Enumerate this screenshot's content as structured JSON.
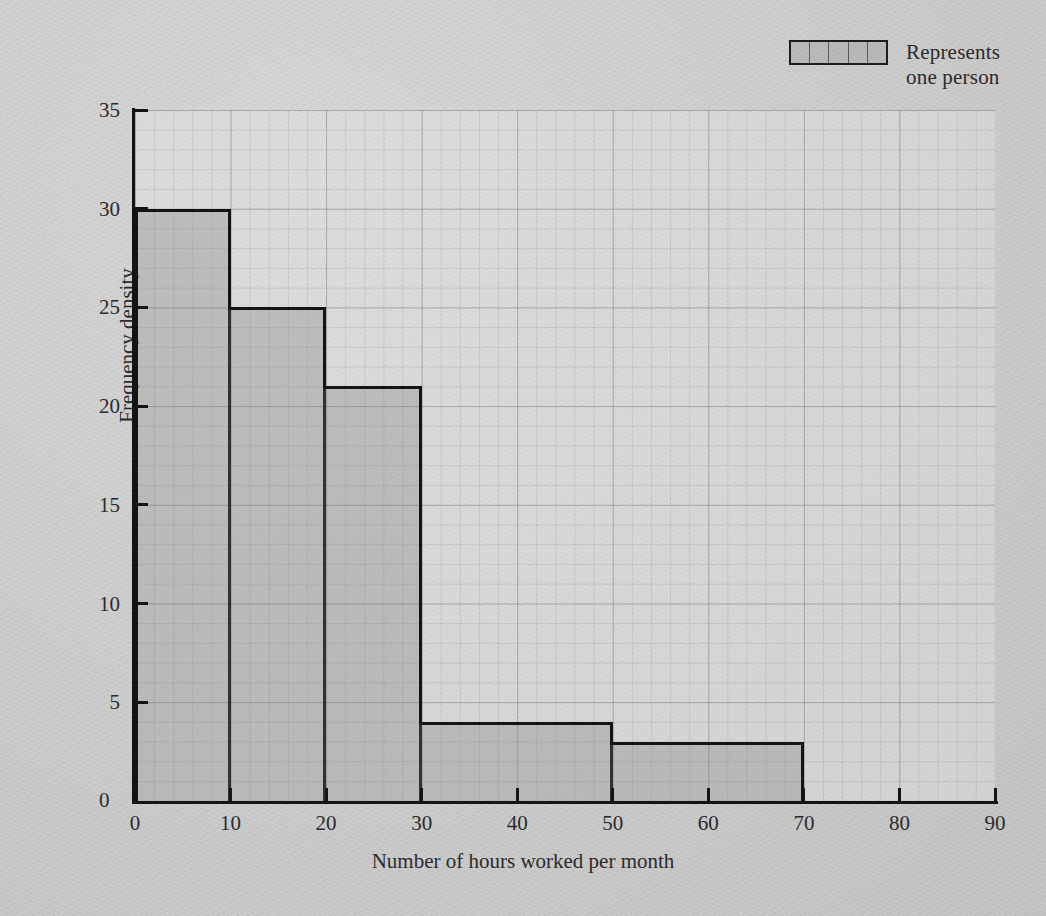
{
  "legend": {
    "label": "Represents\none person",
    "swatch_cells": 5,
    "swatch_name": "legend-swatch"
  },
  "axis_titles": {
    "x": "Number of hours worked per month",
    "y": "Frequency density"
  },
  "origin_label": "0",
  "colors": {
    "page_background": "#cacaca",
    "plot_background": "#e4e4e4",
    "bar_fill": "#9b9b9b",
    "bar_stroke": "#141414",
    "grid_major": "#5a5a5a",
    "grid_minor": "#6e6e6e",
    "text": "#2b2b2b"
  },
  "chart_data": {
    "type": "bar",
    "title": "",
    "subtitle": "",
    "xlabel": "Number of hours worked per month",
    "ylabel": "Frequency density",
    "xlim": [
      0,
      90
    ],
    "ylim": [
      0,
      35
    ],
    "xticks": [
      0,
      10,
      20,
      30,
      40,
      50,
      60,
      70,
      80,
      90
    ],
    "yticks": [
      0,
      5,
      10,
      15,
      20,
      25,
      30,
      35
    ],
    "grid": true,
    "grid_minor_step_x": 2,
    "grid_minor_step_y": 1,
    "legend": {
      "position": "top-right",
      "entries": [
        "Represents one person"
      ]
    },
    "bins": [
      {
        "label": "0-10",
        "x_start": 0,
        "x_end": 10,
        "frequency_density": 30,
        "frequency": 300
      },
      {
        "label": "10-20",
        "x_start": 10,
        "x_end": 20,
        "frequency_density": 25,
        "frequency": 250
      },
      {
        "label": "20-30",
        "x_start": 20,
        "x_end": 30,
        "frequency_density": 21,
        "frequency": 210
      },
      {
        "label": "30-50",
        "x_start": 30,
        "x_end": 50,
        "frequency_density": 4,
        "frequency": 80
      },
      {
        "label": "50-70",
        "x_start": 50,
        "x_end": 70,
        "frequency_density": 3,
        "frequency": 60
      }
    ],
    "categories": [
      "0-10",
      "10-20",
      "20-30",
      "30-50",
      "50-70"
    ],
    "values": [
      30,
      25,
      21,
      4,
      3
    ]
  }
}
